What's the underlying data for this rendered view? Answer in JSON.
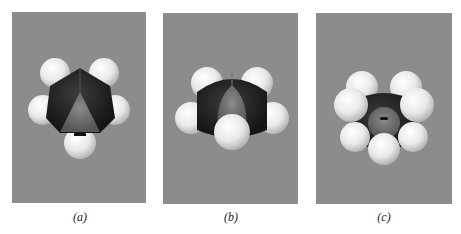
{
  "figure": {
    "panels": [
      {
        "id": "a",
        "label": "(a)",
        "subject": "space-filling molecular model, view a"
      },
      {
        "id": "b",
        "label": "(b)",
        "subject": "space-filling molecular model, view b"
      },
      {
        "id": "c",
        "label": "(c)",
        "subject": "space-filling molecular model, view c"
      }
    ],
    "colors": {
      "background": "#8c8c8c",
      "carbon": "#2a2a2a",
      "hydrogen": "#f2f2f2",
      "center": "#6a6a6a"
    }
  }
}
